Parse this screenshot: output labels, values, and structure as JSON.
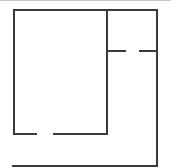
{
  "diagram": {
    "type": "floor-plan",
    "stroke_color": "#3a3a3a",
    "border_color": "#c8c8c8",
    "stroke_width": 2,
    "walls": [
      {
        "name": "outer-top-wall",
        "x1": 14,
        "y1": 10,
        "x2": 157,
        "y2": 10
      },
      {
        "name": "outer-left-wall",
        "x1": 14,
        "y1": 10,
        "x2": 14,
        "y2": 134
      },
      {
        "name": "outer-right-wall",
        "x1": 157,
        "y1": 10,
        "x2": 157,
        "y2": 166
      },
      {
        "name": "inner-divider-wall",
        "x1": 107,
        "y1": 10,
        "x2": 107,
        "y2": 134
      },
      {
        "name": "room-bottom-wall-left",
        "x1": 14,
        "y1": 134,
        "x2": 36,
        "y2": 134
      },
      {
        "name": "room-bottom-wall-right",
        "x1": 54,
        "y1": 134,
        "x2": 107,
        "y2": 134
      },
      {
        "name": "closet-wall-left",
        "x1": 107,
        "y1": 51,
        "x2": 125,
        "y2": 51
      },
      {
        "name": "closet-wall-right",
        "x1": 140,
        "y1": 51,
        "x2": 157,
        "y2": 51
      },
      {
        "name": "bottom-wall",
        "x1": 13,
        "y1": 166,
        "x2": 157,
        "y2": 166
      }
    ]
  }
}
